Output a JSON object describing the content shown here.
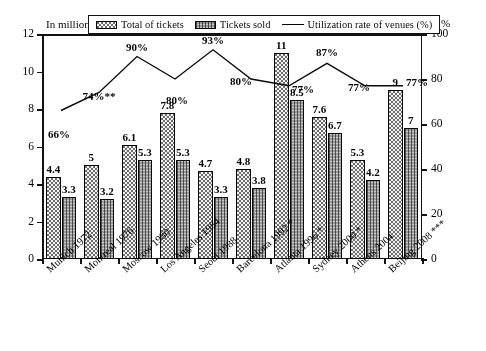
{
  "chart_data": {
    "type": "bar",
    "title": "",
    "xlabel": "",
    "ylabel": "In million",
    "y2label": "%",
    "ylim": [
      0,
      12
    ],
    "y2lim": [
      0,
      100
    ],
    "grid": false,
    "legend_position": "top-center",
    "categories": [
      "Munich 1972",
      "Montreal 1976",
      "Moscow 1980",
      "Los Angeles 1984",
      "Seoul 1988",
      "Barcelona 1992 *",
      "Atlanta 1996 *",
      "Sydney 2000 *",
      "Athens 2004",
      "Beijing 2008 ***"
    ],
    "series": [
      {
        "name": "Total of tickets",
        "type": "bar",
        "axis": "left",
        "values": [
          4.4,
          5,
          6.1,
          7.8,
          4.7,
          4.8,
          11,
          7.6,
          5.3,
          9
        ],
        "labels": [
          "4.4",
          "5",
          "6.1",
          "7.8",
          "4.7",
          "4.8",
          "11",
          "7.6",
          "5.3",
          "9"
        ]
      },
      {
        "name": "Tickets sold",
        "type": "bar",
        "axis": "left",
        "values": [
          3.3,
          3.2,
          5.3,
          5.3,
          3.3,
          3.8,
          8.5,
          6.7,
          4.2,
          7
        ],
        "labels": [
          "3.3",
          "3.2",
          "5.3",
          "5.3",
          "3.3",
          "3.8",
          "8.5",
          "6.7",
          "4.2",
          "7"
        ]
      },
      {
        "name": "Utilization rate of venues (%)",
        "type": "line",
        "axis": "right",
        "values": [
          66,
          74,
          90,
          80,
          93,
          80,
          77,
          87,
          77,
          77
        ],
        "labels": [
          "66%",
          "74%**",
          "90%",
          "80%",
          "93%",
          "80%",
          "77%",
          "87%",
          "77%",
          "77%"
        ]
      }
    ],
    "y_ticks": [
      0,
      2,
      4,
      6,
      8,
      10,
      12
    ],
    "y_tick_labels": [
      "0",
      "2",
      "4",
      "6",
      "8",
      "10",
      "12"
    ],
    "y2_ticks": [
      0,
      20,
      40,
      60,
      80,
      100
    ],
    "y2_tick_labels": [
      "0",
      "20",
      "40",
      "60",
      "80",
      "100"
    ]
  },
  "legend": {
    "items": [
      {
        "label": "Total of tickets",
        "swatch": "total"
      },
      {
        "label": "Tickets sold",
        "swatch": "sold"
      },
      {
        "label": "Utilization rate of venues (%)",
        "swatch": "line"
      }
    ]
  },
  "axes": {
    "left_caption": "In million",
    "right_caption": "%"
  }
}
